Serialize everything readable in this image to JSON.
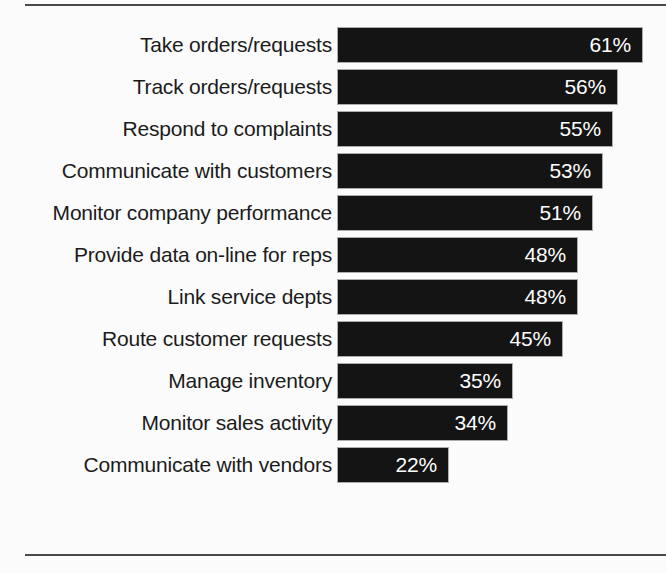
{
  "chart_data": {
    "type": "bar",
    "orientation": "horizontal",
    "title": "",
    "subtitle": "",
    "xlabel": "",
    "ylabel": "",
    "xlim": [
      0,
      61
    ],
    "grid": false,
    "legend": false,
    "value_suffix": "%",
    "bar_color": "#141414",
    "value_label_color": "#ffffff",
    "category_label_color": "#1b1b1b",
    "background_color": "#fbfbfb",
    "rule_color": "#4a4a4a",
    "categories": [
      "Take orders/requests",
      "Track orders/requests",
      "Respond to complaints",
      "Communicate with customers",
      "Monitor company performance",
      "Provide data on-line for reps",
      "Link service depts",
      "Route customer requests",
      "Manage inventory",
      "Monitor sales activity",
      "Communicate with vendors"
    ],
    "values": [
      61,
      56,
      55,
      53,
      51,
      48,
      48,
      45,
      35,
      34,
      22
    ],
    "value_labels": [
      "61%",
      "56%",
      "55%",
      "53%",
      "51%",
      "48%",
      "48%",
      "45%",
      "35%",
      "34%",
      "22%"
    ],
    "bars": [
      {
        "label": "Take orders/requests",
        "value": 61,
        "value_label": "61%"
      },
      {
        "label": "Track orders/requests",
        "value": 56,
        "value_label": "56%"
      },
      {
        "label": "Respond to complaints",
        "value": 55,
        "value_label": "55%"
      },
      {
        "label": "Communicate with customers",
        "value": 53,
        "value_label": "53%"
      },
      {
        "label": "Monitor company performance",
        "value": 51,
        "value_label": "51%"
      },
      {
        "label": "Provide data on-line for reps",
        "value": 48,
        "value_label": "48%"
      },
      {
        "label": "Link service depts",
        "value": 48,
        "value_label": "48%"
      },
      {
        "label": "Route customer requests",
        "value": 45,
        "value_label": "45%"
      },
      {
        "label": "Manage inventory",
        "value": 35,
        "value_label": "35%"
      },
      {
        "label": "Monitor sales activity",
        "value": 34,
        "value_label": "34%"
      },
      {
        "label": "Communicate with vendors",
        "value": 22,
        "value_label": "22%"
      }
    ]
  },
  "layout": {
    "bar_origin_x": 338,
    "bar_max_right_x": 642,
    "row_pitch": 42,
    "bar_height": 34,
    "plot_top": 28
  }
}
